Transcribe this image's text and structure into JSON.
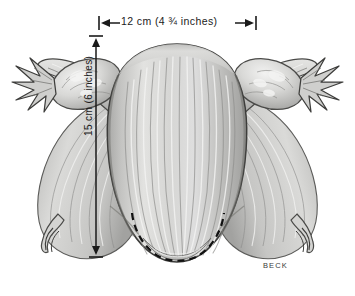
{
  "figure": {
    "background_color": "#ffffff",
    "width": 355,
    "height": 296
  },
  "measurements": {
    "horizontal": {
      "label": "12 cm (4 ¾ inches)",
      "value_cm": 12,
      "value_inches": "4 ¾",
      "orientation": "horizontal",
      "position": "top",
      "arrow_style": "double-headed-with-end-bars",
      "color": "#1a1a1a"
    },
    "vertical": {
      "label": "15 cm (6 inches)",
      "value_cm": 15,
      "value_inches": "6",
      "orientation": "vertical",
      "position": "left",
      "arrow_style": "double-headed-with-end-bars",
      "color": "#1a1a1a"
    }
  },
  "annotations": {
    "cervix_outline": {
      "name": "dashed-cervix-outline",
      "style": "dashed",
      "color": "#111111"
    },
    "signature": {
      "text": "BECK",
      "color": "#3a3a3a"
    }
  },
  "anatomy": {
    "structures": [
      {
        "name": "uterine-fundus",
        "side": "center"
      },
      {
        "name": "uterine-body",
        "side": "center"
      },
      {
        "name": "cervix",
        "side": "center"
      },
      {
        "name": "fallopian-tube",
        "side": "left"
      },
      {
        "name": "fallopian-tube",
        "side": "right"
      },
      {
        "name": "fimbriae",
        "side": "left"
      },
      {
        "name": "fimbriae",
        "side": "right"
      },
      {
        "name": "ovary",
        "side": "left"
      },
      {
        "name": "ovary",
        "side": "right"
      },
      {
        "name": "broad-ligament",
        "side": "left"
      },
      {
        "name": "broad-ligament",
        "side": "right"
      },
      {
        "name": "round-ligament",
        "side": "left"
      },
      {
        "name": "round-ligament",
        "side": "right"
      }
    ],
    "palette": {
      "tissue_light": "#e6e6e4",
      "tissue_mid": "#c9c9c7",
      "tissue_shadow": "#9a9a98",
      "tissue_dark": "#6e6e6c",
      "outline": "#3d3d3b",
      "highlight": "#f7f7f6"
    }
  }
}
